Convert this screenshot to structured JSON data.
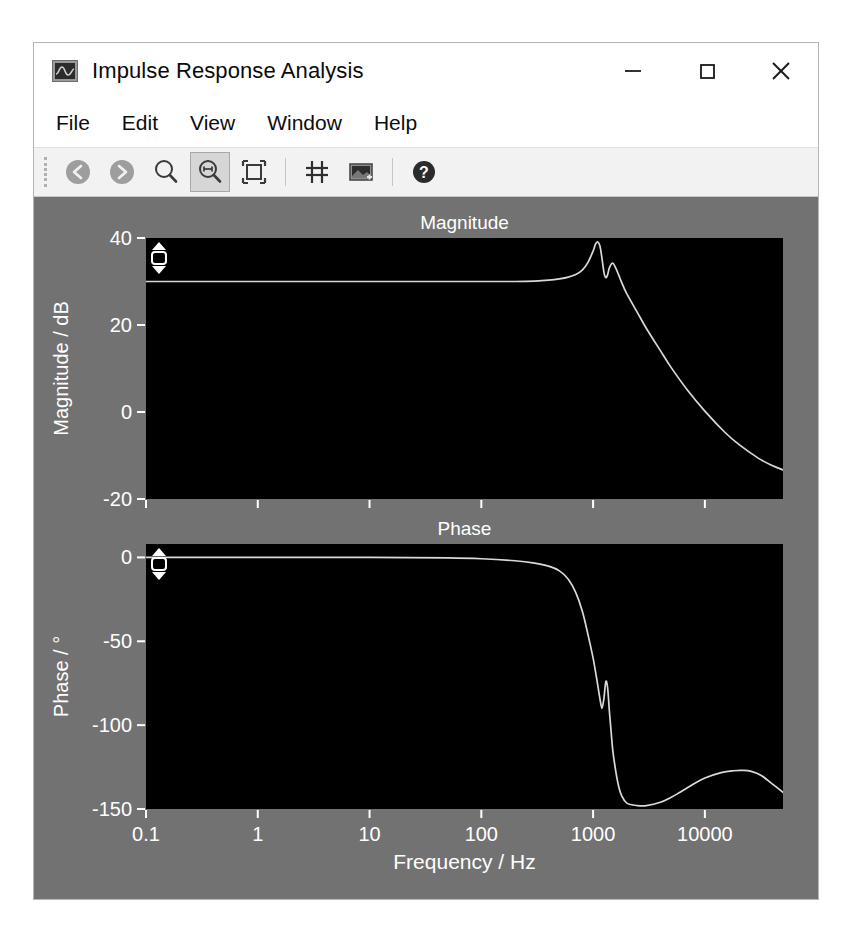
{
  "window": {
    "title": "Impulse Response Analysis",
    "app_icon": "waveform-icon",
    "controls": {
      "minimize": "–",
      "maximize": "□",
      "close": "×"
    }
  },
  "menu": {
    "items": [
      {
        "label": "File"
      },
      {
        "label": "Edit"
      },
      {
        "label": "View"
      },
      {
        "label": "Window"
      },
      {
        "label": "Help"
      }
    ]
  },
  "toolbar": {
    "buttons": [
      {
        "name": "back-icon",
        "tooltip": "Back",
        "active": false
      },
      {
        "name": "forward-icon",
        "tooltip": "Forward",
        "active": false
      },
      {
        "name": "zoom-icon",
        "tooltip": "Zoom",
        "active": false
      },
      {
        "name": "zoom-horizontal-icon",
        "tooltip": "Zoom Horizontal",
        "active": true
      },
      {
        "name": "fit-to-window-icon",
        "tooltip": "Fit to Window",
        "active": false
      },
      {
        "name": "cursor-marker-icon",
        "tooltip": "Cursors",
        "active": false
      },
      {
        "name": "export-image-icon",
        "tooltip": "Export Image",
        "active": false
      },
      {
        "name": "help-icon",
        "tooltip": "Help",
        "active": false
      }
    ]
  },
  "colors": {
    "plot_background": "#727272",
    "axes_background": "#000000",
    "trace": "#d9d9d9",
    "tick_text": "#ffffff",
    "window_chrome": "#ffffff",
    "toolbar": "#f2f2f2"
  },
  "chart_data": [
    {
      "type": "line",
      "title": "Magnitude",
      "xlabel": "",
      "ylabel": "Magnitude / dB",
      "xscale": "log",
      "xlim": [
        0.1,
        50000
      ],
      "ylim": [
        -20,
        40
      ],
      "xticks": [
        0.1,
        1,
        10,
        100,
        1000,
        10000
      ],
      "xticklabels": [
        "0.1",
        "1",
        "10",
        "100",
        "1000",
        "10000"
      ],
      "yticks": [
        40,
        20,
        0,
        -20
      ],
      "yticklabels": [
        "40",
        "20",
        "0",
        "-20"
      ],
      "grid": false,
      "series": [
        {
          "name": "magnitude",
          "x": [
            0.1,
            0.3,
            1,
            3,
            10,
            30,
            100,
            200,
            300,
            400,
            500,
            600,
            700,
            800,
            900,
            1000,
            1050,
            1100,
            1150,
            1200,
            1250,
            1300,
            1350,
            1400,
            1500,
            1600,
            1700,
            1800,
            2000,
            2500,
            3000,
            4000,
            5000,
            7000,
            10000,
            15000,
            20000,
            30000,
            40000,
            50000
          ],
          "y": [
            30.0,
            30.0,
            30.0,
            30.0,
            30.0,
            30.0,
            30.0,
            30.0,
            30.1,
            30.3,
            30.6,
            31.0,
            31.6,
            32.6,
            34.4,
            37.0,
            38.6,
            39.1,
            38.2,
            35.4,
            32.1,
            30.9,
            31.6,
            33.2,
            34.2,
            33.0,
            31.4,
            29.8,
            27.2,
            22.8,
            19.2,
            14.1,
            10.2,
            5.0,
            0.2,
            -4.6,
            -7.4,
            -10.6,
            -12.3,
            -13.3
          ]
        }
      ]
    },
    {
      "type": "line",
      "title": "Phase",
      "xlabel": "Frequency / Hz",
      "ylabel": "Phase / °",
      "xscale": "log",
      "xlim": [
        0.1,
        50000
      ],
      "ylim": [
        -150,
        8
      ],
      "xticks": [
        0.1,
        1,
        10,
        100,
        1000,
        10000
      ],
      "xticklabels": [
        "0.1",
        "1",
        "10",
        "100",
        "1000",
        "10000"
      ],
      "yticks": [
        0,
        -50,
        -100,
        -150
      ],
      "yticklabels": [
        "0",
        "-50",
        "-100",
        "-150"
      ],
      "grid": false,
      "series": [
        {
          "name": "phase",
          "x": [
            0.1,
            1,
            10,
            50,
            100,
            200,
            300,
            400,
            500,
            600,
            700,
            800,
            900,
            1000,
            1050,
            1100,
            1150,
            1200,
            1250,
            1300,
            1350,
            1400,
            1450,
            1500,
            1600,
            1700,
            1800,
            2000,
            2500,
            3000,
            4000,
            5000,
            6000,
            8000,
            10000,
            14000,
            18000,
            22000,
            26000,
            32000,
            40000,
            50000
          ],
          "y": [
            0.0,
            0.0,
            0.0,
            -0.3,
            -0.8,
            -2.0,
            -3.4,
            -5.2,
            -8.0,
            -13.0,
            -21.0,
            -32.0,
            -46.0,
            -60.0,
            -68.0,
            -76.0,
            -84.0,
            -90.0,
            -84.0,
            -74.0,
            -78.0,
            -92.0,
            -104.0,
            -115.0,
            -128.0,
            -137.0,
            -142.0,
            -146.5,
            -148.0,
            -148.0,
            -146.0,
            -143.0,
            -140.0,
            -135.0,
            -131.5,
            -128.3,
            -127.2,
            -127.0,
            -127.6,
            -130.0,
            -135.0,
            -140.0
          ]
        }
      ]
    }
  ]
}
